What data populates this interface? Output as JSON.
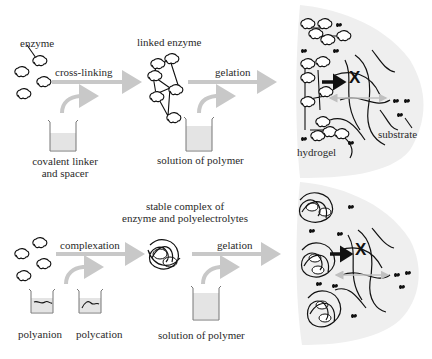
{
  "colors": {
    "arrow": "#c8c8c8",
    "beaker_fill": "#e4e4e4",
    "hydrogel_bg": "#efefef",
    "ink": "#111111"
  },
  "top_row": {
    "enzyme_label": "enzyme",
    "step1_label": "cross-linking",
    "reagent1_label_line1": "covalent linker",
    "reagent1_label_line2": "and spacer",
    "intermediate_label": "linked enzyme",
    "step2_label": "gelation",
    "reagent2_label": "solution of polymer",
    "hydrogel_label": "hydrogel",
    "substrate_label": "substrate",
    "blocked_symbol": "X"
  },
  "bottom_row": {
    "step1_label": "complexation",
    "reagent_a_label": "polyanion",
    "reagent_b_label": "polycation",
    "intermediate_label_line1": "stable complex of",
    "intermediate_label_line2": "enzyme and polyelectrolytes",
    "step2_label": "gelation",
    "reagent2_label": "solution of polymer",
    "blocked_symbol": "X"
  }
}
